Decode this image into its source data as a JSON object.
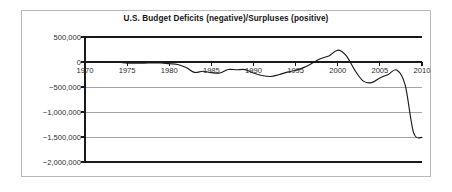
{
  "chart_data": {
    "type": "line",
    "title": "U.S. Budget Deficits (negative)/Surpluses (positive)",
    "xlabel": "",
    "ylabel": "",
    "xlim": [
      1970,
      2010
    ],
    "ylim": [
      -2000000,
      500000
    ],
    "grid": true,
    "legend": false,
    "y_ticks": [
      500000,
      0,
      -500000,
      -1000000,
      -1500000,
      -2000000
    ],
    "y_tick_labels": [
      "500,000",
      "0",
      "−500,000",
      "−1,000,000",
      "−1,500,000",
      "−2,000,000"
    ],
    "x_ticks": [
      1970,
      1975,
      1980,
      1985,
      1990,
      1995,
      2000,
      2005,
      2010
    ],
    "x_tick_labels": [
      "1970",
      "1975",
      "1980",
      "1985",
      "1990",
      "1995",
      "2000",
      "2005",
      "2010"
    ],
    "series": [
      {
        "name": "U.S. Budget Surplus/Deficit",
        "color": "#1a1a1a",
        "x": [
          1970,
          1971,
          1972,
          1973,
          1974,
          1975,
          1976,
          1977,
          1978,
          1979,
          1980,
          1981,
          1982,
          1983,
          1984,
          1985,
          1986,
          1987,
          1988,
          1989,
          1990,
          1991,
          1992,
          1993,
          1994,
          1995,
          1996,
          1997,
          1998,
          1999,
          2000,
          2001,
          2002,
          2003,
          2004,
          2005,
          2006,
          2007,
          2008,
          2009,
          2010
        ],
        "values": [
          -3000,
          -8000,
          -10000,
          -5000,
          -6000,
          -22000,
          -24000,
          -22000,
          -20000,
          -18000,
          -35000,
          -50000,
          -110000,
          -208000,
          -185000,
          -212000,
          -221000,
          -150000,
          -155000,
          -152000,
          -221000,
          -269000,
          -290000,
          -255000,
          -203000,
          -164000,
          -107000,
          -22000,
          69000,
          126000,
          236000,
          128000,
          -158000,
          -378000,
          -413000,
          -318000,
          -248000,
          -161000,
          -459000,
          -1413000,
          -1510000
        ]
      }
    ]
  }
}
